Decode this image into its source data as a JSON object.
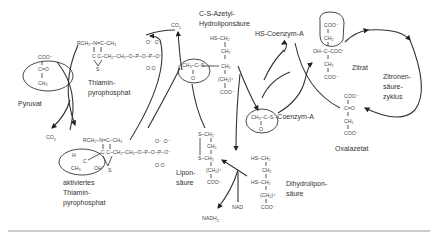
{
  "diagram": {
    "title": "",
    "labels": {
      "pyruvat": "Pyruvat",
      "thiamin": "Thiamin-",
      "pyrophosphat": "pyrophosphat",
      "aktiviertes": "aktiviertes",
      "thiamin2": "Thiamin-",
      "pyrophosphat2": "pyrophosphat",
      "acetyl_hydrolipon_1": "C-S-Azetyl-",
      "acetyl_hydrolipon_2": "Hydroliponsäure",
      "hs_coa": "HS-Coenzym-A",
      "acetyl_coa_suffix": "-Coenzym-A",
      "zitrat": "Zitrat",
      "zyklus_1": "Zitronen-",
      "zyklus_2": "säure-",
      "zyklus_3": "zyklus",
      "oxalazetat": "Oxalazetat",
      "lipon_1": "Lipon-",
      "lipon_2": "säure",
      "dihydrolipon_1": "Dihydrolipon-",
      "dihydrolipon_2": "säure",
      "nad": "NAD",
      "nadh2": "NADH",
      "nadh2_sub": "2",
      "co2_top": "CO",
      "co2_top_sub": "2",
      "co2_left": "CO",
      "co2_left_sub": "2"
    },
    "formulas": {
      "pyruvat_coo": "COO⁻",
      "pyruvat_co": "C=O",
      "pyruvat_ch3": "CH₃",
      "tpp_top": "RCH₂–N=C–CH₃",
      "tpp_chain": "C  C–CH₂–CH₂–O–P–O–P–O⁻",
      "tpp_s": "S",
      "tpp_o_minus": "O⁻   O⁻",
      "tpp_o": "O    O",
      "atpp_top": "RCH₂–N=C–CH₃",
      "atpp_h": "H",
      "atpp_c": "C",
      "atpp_ch3": "CH₃",
      "atpp_oh": "OH",
      "atpp_chain": "C  C–CH₂–CH₂–O–P–O–P–O⁻",
      "atpp_s": "S",
      "atpp_o_minus": "O⁻   O⁻",
      "atpp_o": "O    O",
      "acetyl_hs_ch2": "HS–CH₂",
      "acetyl_ch2_a": "CH₂",
      "acetyl_group": "CH₃–C–S",
      "acetyl_o": "O",
      "acetyl_ch2_b": "CH₂",
      "acetyl_ch2n": "(CH₂)⁴",
      "acetyl_coo": "COO⁻",
      "zitrat_coo1": "COO⁻",
      "zitrat_ch2a": "CH₂",
      "zitrat_mid": "OH–C–COO⁻",
      "zitrat_ch2b": "CH₂",
      "zitrat_coo2": "COO⁻",
      "acoa_group": "CH₃–C–S",
      "acoa_o": "O",
      "oxa_coo1": "COO⁻",
      "oxa_co": "C=O",
      "oxa_ch2": "CH₂",
      "oxa_coo2": "COO⁻",
      "lipon_s1": "S–CH₂",
      "lipon_ch2": "CH₂",
      "lipon_s2": "S–CH₂",
      "lipon_ch2n": "(CH₂)⁴",
      "lipon_coo": "COO⁻",
      "dhl_hs1": "HS–CH₂",
      "dhl_ch2": "CH₂",
      "dhl_hs2": "HS–CH₂",
      "dhl_ch2n": "(CH₂)⁴",
      "dhl_coo": "COO⁻"
    },
    "colors": {
      "ink": "#333333",
      "rule": "#999999",
      "background": "#ffffff"
    }
  }
}
